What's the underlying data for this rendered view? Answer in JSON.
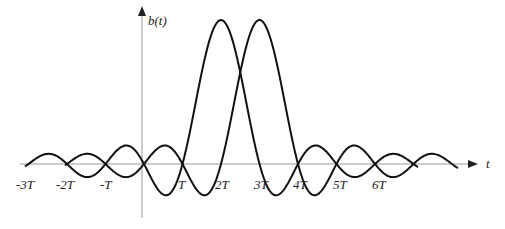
{
  "diagram": {
    "title": "",
    "y_axis_label": "b(t)",
    "x_axis_label": "t",
    "tick_labels": [
      "-3T",
      "-2T",
      "-T",
      "T",
      "2T",
      "3T",
      "4T",
      "5T",
      "6T"
    ],
    "curves": [
      {
        "name": "pulse-1",
        "peak_at": "~1.5T (between T and 2T)",
        "shape": "sinc"
      },
      {
        "name": "pulse-2",
        "peak_at": "~2.5T (between 2T and 3T)",
        "shape": "sinc"
      }
    ],
    "colors": {
      "curve": "#111111",
      "axis": "#888888",
      "text": "#222222"
    }
  }
}
